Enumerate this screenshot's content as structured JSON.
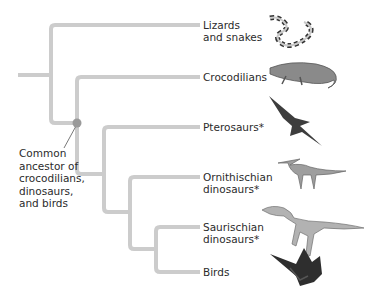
{
  "diagram": {
    "type": "phylogenetic-tree",
    "branch_color": "#cccccc",
    "node_color": "#9a9a9a",
    "taxa": [
      {
        "label": "Lizards\nand snakes",
        "icon": "snake-icon"
      },
      {
        "label": "Crocodilians",
        "icon": "crocodile-icon"
      },
      {
        "label": "Pterosaurs*",
        "icon": "pterosaur-icon"
      },
      {
        "label": "Ornithischian\ndinosaurs*",
        "icon": "ornithischian-dinosaur-icon"
      },
      {
        "label": "Saurischian\ndinosaurs*",
        "icon": "saurischian-dinosaur-icon"
      },
      {
        "label": "Birds",
        "icon": "bird-icon"
      }
    ],
    "annotation": {
      "label": "Common\nancestor of\ncrocodilians,\ndinosaurs,\nand birds"
    }
  }
}
